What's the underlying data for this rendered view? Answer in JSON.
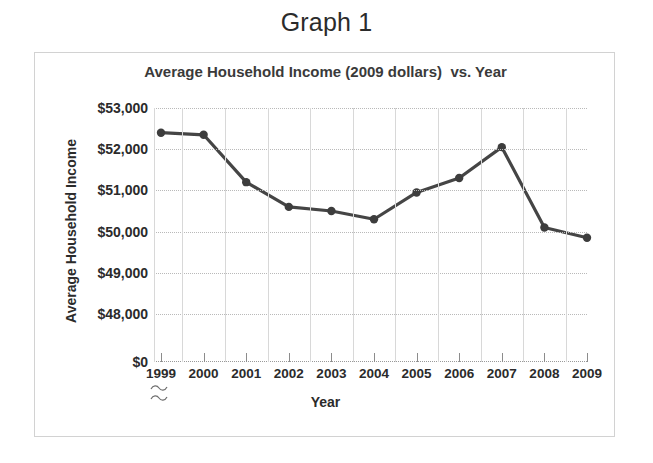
{
  "figure": {
    "heading": "Graph 1"
  },
  "chart_data": {
    "type": "line",
    "title": "Average Household Income (2009 dollars)  vs. Year",
    "xlabel": "Year",
    "ylabel": "Average Household Income",
    "categories": [
      "1999",
      "2000",
      "2001",
      "2002",
      "2003",
      "2004",
      "2005",
      "2006",
      "2007",
      "2008",
      "2009"
    ],
    "values": [
      52400,
      52350,
      51200,
      50600,
      50500,
      50300,
      50950,
      51300,
      52050,
      50100,
      49850
    ],
    "series": [
      {
        "name": "Average Household Income",
        "values": [
          52400,
          52350,
          51200,
          50600,
          50500,
          50300,
          50950,
          51300,
          52050,
          50100,
          49850
        ]
      }
    ],
    "ytick_labels": [
      "$53,000",
      "$52,000",
      "$51,000",
      "$50,000",
      "$49,000",
      "$48,000",
      "$0"
    ],
    "ytick_values": [
      53000,
      52000,
      51000,
      50000,
      49000,
      48000,
      0
    ],
    "ylim": [
      48000,
      53000
    ],
    "axis_break": true,
    "axis_break_note": "y-axis broken between $48,000 and $0",
    "grid": true,
    "legend": "none",
    "line_color": "#454545",
    "marker": "circle",
    "marker_color": "#3d3d3d"
  }
}
